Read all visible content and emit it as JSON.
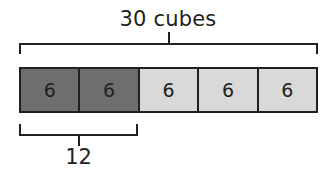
{
  "diagram": {
    "type": "tape-diagram",
    "background_color": "#ffffff",
    "line_color": "#231f20",
    "total_label": "30 cubes",
    "part_label": "12",
    "cells": [
      {
        "value": "6",
        "shade": "dark",
        "color": "#6e6e6e"
      },
      {
        "value": "6",
        "shade": "dark",
        "color": "#6e6e6e"
      },
      {
        "value": "6",
        "shade": "light",
        "color": "#d9d9d9"
      },
      {
        "value": "6",
        "shade": "light",
        "color": "#d9d9d9"
      },
      {
        "value": "6",
        "shade": "light",
        "color": "#d9d9d9"
      }
    ],
    "top_bracket": {
      "spans_cells": 5,
      "label": "30 cubes"
    },
    "bottom_bracket": {
      "spans_cells": 2,
      "label": "12"
    }
  }
}
